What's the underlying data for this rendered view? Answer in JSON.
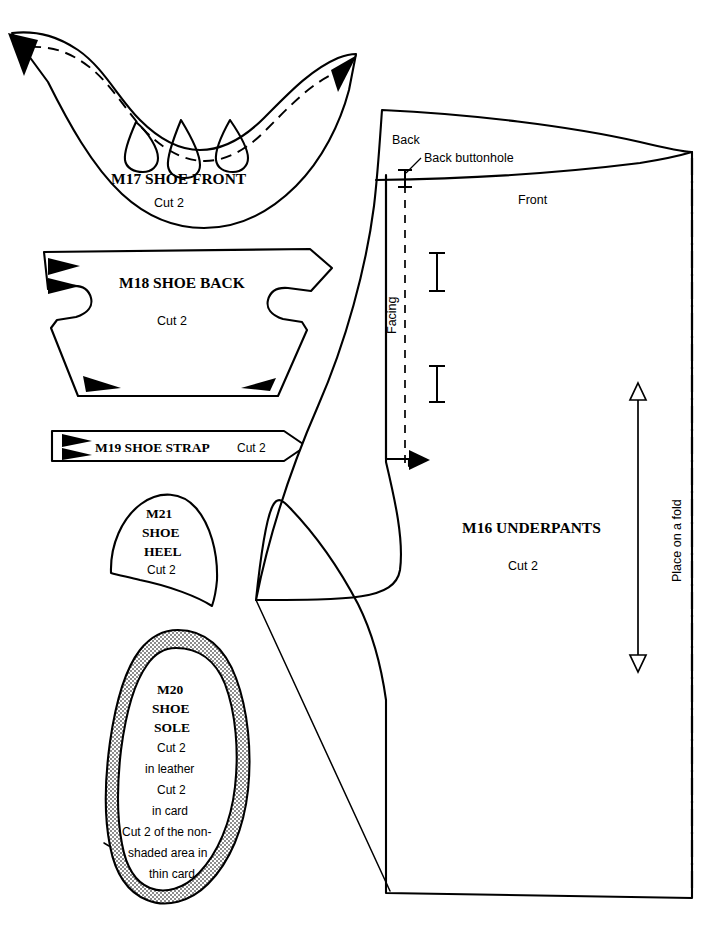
{
  "sheet": {
    "title": "Doll clothing sewing pattern sheet",
    "ink_color": "#000000",
    "paper_color": "#ffffff",
    "shade_color": "#b4b4b4"
  },
  "pieces": [
    {
      "id": "M17",
      "code": "M17",
      "name": "SHOE FRONT",
      "cut": "Cut 2",
      "heading": "M17  SHOE FRONT",
      "notches": 2,
      "darts": 3,
      "stitch_line": "dashed"
    },
    {
      "id": "M18",
      "code": "M18",
      "name": "SHOE BACK",
      "cut": "Cut 2",
      "heading": "M18  SHOE BACK",
      "notches": 4
    },
    {
      "id": "M19",
      "code": "M19",
      "name": "SHOE STRAP",
      "cut": "Cut 2",
      "heading": "M19  SHOE STRAP",
      "notches": 2
    },
    {
      "id": "M21",
      "code": "M21",
      "name_line1": "SHOE",
      "name_line2": "HEEL",
      "cut": "Cut 2"
    },
    {
      "id": "M20",
      "code": "M20",
      "name_line1": "SHOE",
      "name_line2": "SOLE",
      "instructions": [
        "Cut 2",
        "in leather",
        "Cut 2",
        "in card",
        "Cut 2 of the non-",
        "shaded area in",
        "thin card"
      ],
      "shaded": true
    },
    {
      "id": "M16",
      "code": "M16",
      "name": "UNDERPANTS",
      "cut": "Cut 2",
      "heading": "M16  UNDERPANTS",
      "annotations": {
        "back": "Back",
        "front": "Front",
        "back_buttonhole": "Back buttonhole",
        "facing": "Facing",
        "place_on_fold": "Place on a fold"
      },
      "buttonholes": 2,
      "grainline": "double-headed arrow",
      "fold_edge": "right"
    }
  ]
}
